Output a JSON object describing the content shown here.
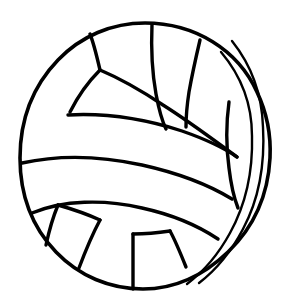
{
  "document": {
    "title": "Volleyball Line Art",
    "type": "line-drawing",
    "subject": "volleyball",
    "style": "black outline coloring page",
    "width": 288,
    "height": 304
  },
  "colors": {
    "background": "#ffffff",
    "stroke": "#000000",
    "fill": "#ffffff"
  },
  "ball": {
    "center_x": 145,
    "center_y": 156,
    "radius_x": 125,
    "radius_y": 133,
    "outline_stroke_width": 3.6,
    "seam_stroke_width": 3.4,
    "thin_seam_stroke_width": 2.4
  },
  "geometry": {
    "outline": "M 145 23 C 195 23 238 50 257 92 C 268 115 271 138 270 158 C 268 196 253 228 228 252 C 203 276 174 289 143 289 C 110 289 79 276 56 252 C 31 226 20 194 20 158 C 20 120 33 86 58 60 C 81 36 112 23 145 23 Z",
    "seams": [
      {
        "name": "right-crescent-outer",
        "d": "M 232 41 C 252 66 262 95 263 127 C 265 163 259 199 243 229 C 231 252 216 270 199 283"
      },
      {
        "name": "right-crescent-inner",
        "d": "M 221 52 C 243 78 252 106 252 136 C 253 172 246 204 230 233 C 218 255 203 272 187 284"
      },
      {
        "name": "upper-band-top",
        "d": "M 68 115 C 104 113 145 119 182 131 C 205 139 224 148 237 157"
      },
      {
        "name": "upper-band-bottom",
        "d": "M 22 163 C 58 155 101 156 142 165 C 178 173 209 185 232 199"
      },
      {
        "name": "lower-band-bottom",
        "d": "M 32 213 C 63 200 104 199 142 208 C 174 215 200 227 218 239"
      },
      {
        "name": "top-vertical-seam",
        "d": "M 152 24 C 151 48 152 72 156 94 C 159 110 162 121 166 129"
      },
      {
        "name": "top-left-diagonal",
        "d": "M 100 70 C 119 78 142 91 163 105 C 190 122 215 141 237 157"
      },
      {
        "name": "top-left-upper",
        "d": "M 100 70 C 97 57 94 44 90 34"
      },
      {
        "name": "top-left-lower",
        "d": "M 100 70 C 89 81 79 94 70 112"
      },
      {
        "name": "top-right-rib",
        "d": "M 200 40 C 196 57 192 75 189 92 C 187 105 186 117 186 127"
      },
      {
        "name": "right-upper-vertical",
        "d": "M 229 102 C 226 124 226 146 229 168 C 231 185 234 198 238 208"
      },
      {
        "name": "bottom-left-rib-a",
        "d": "M 58 205 C 53 217 49 231 46 245"
      },
      {
        "name": "bottom-left-rib-b",
        "d": "M 100 220 C 92 235 85 252 79 268"
      },
      {
        "name": "bottom-left-connector",
        "d": "M 58 205 C 72 209 87 214 100 220"
      },
      {
        "name": "bottom-center-vertical",
        "d": "M 133 289 C 133 271 133 252 133 234"
      },
      {
        "name": "bottom-right-rib",
        "d": "M 186 267 C 180 252 175 240 170 231"
      },
      {
        "name": "bottom-right-junction",
        "d": "M 170 231 C 157 233 144 234 133 234"
      }
    ]
  }
}
